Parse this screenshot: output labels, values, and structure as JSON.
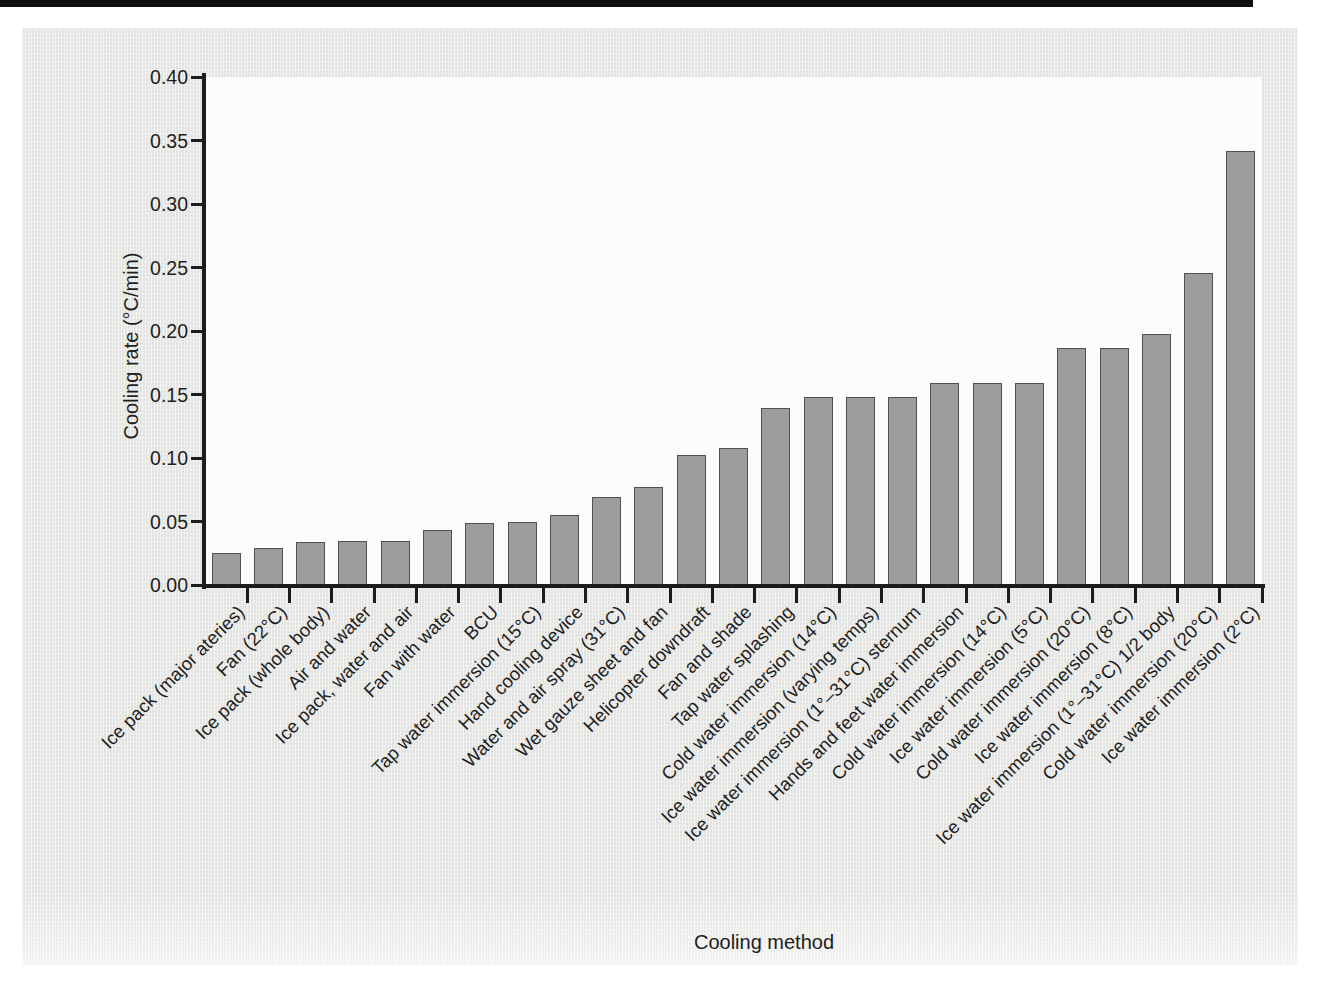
{
  "figure": {
    "x_axis_title": "Cooling method",
    "y_axis_title": "Cooling rate (°C/min)"
  },
  "colors": {
    "page_background": "#e9eae8",
    "plot_background": "#fcfcfb",
    "bar_fill": "#9c9c9c",
    "bar_edge": "#515151",
    "axis": "#1c1c1c",
    "text": "#1e1e1e",
    "scan_strip": "#101010"
  },
  "chart_data": {
    "type": "bar",
    "title": "",
    "xlabel": "Cooling method",
    "ylabel": "Cooling rate (°C/min)",
    "ylim": [
      0,
      0.4
    ],
    "ytick_step": 0.05,
    "ytick_labels": [
      "0.00",
      "0.05",
      "0.10",
      "0.15",
      "0.20",
      "0.25",
      "0.30",
      "0.35",
      "0.40"
    ],
    "grid": "off",
    "legend": "none",
    "categories": [
      "Ice pack (major ateries)",
      "Fan (22°C)",
      "Ice pack (whole body)",
      "Air and water",
      "Ice pack, water and air",
      "Fan with water",
      "BCU",
      "Tap water immersion (15°C)",
      "Hand cooling device",
      "Water and air spray (31°C)",
      "Wet gauze sheet and fan",
      "Helicopter downdraft",
      "Fan and shade",
      "Tap water splashing",
      "Cold water immersion (14°C)",
      "Ice water immersion (varying temps)",
      "Ice water immersion (1°–31°C) sternum",
      "Hands and feet water immersion",
      "Cold water immersion (14°C)",
      "Ice water immersion (5°C)",
      "Cold water immersion (20°C)",
      "Ice water immersion (8°C)",
      "Ice water immersion (1°–31°C) 1/2 body",
      "Cold water immersion (20°C)",
      "Ice water immersion (2°C)"
    ],
    "values": [
      0.025,
      0.029,
      0.034,
      0.035,
      0.035,
      0.043,
      0.049,
      0.05,
      0.055,
      0.069,
      0.077,
      0.102,
      0.108,
      0.139,
      0.148,
      0.148,
      0.148,
      0.159,
      0.159,
      0.159,
      0.187,
      0.187,
      0.198,
      0.246,
      0.342
    ]
  }
}
